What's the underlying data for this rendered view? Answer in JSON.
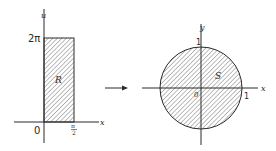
{
  "left_diagram": {
    "vertical_axis_label": "u",
    "horizontal_axis_label": "x",
    "origin_label": "0",
    "top_tick_label": "2π",
    "right_tick_label_num": "π",
    "right_tick_label_den": "2",
    "region_label": "R"
  },
  "arrow": {
    "direction": "right"
  },
  "right_diagram": {
    "vertical_axis_label": "y",
    "horizontal_axis_label": "x",
    "origin_label": "0",
    "y_tick_label": "1",
    "x_tick_label": "1",
    "region_label": "S"
  },
  "colors": {
    "line": "#2a2a2a",
    "hatch": "#5a5a5a",
    "background": "#ffffff"
  }
}
